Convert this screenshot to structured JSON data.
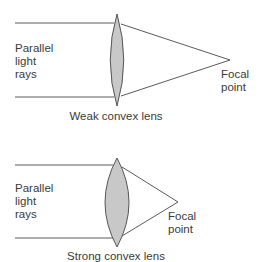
{
  "colors": {
    "line": "#5a5a5a",
    "lens_fill": "#c8c8c8",
    "lens_stroke": "#555555",
    "text": "#3a3a3a",
    "background": "#ffffff"
  },
  "panels": [
    {
      "id": "weak",
      "rays_label": "Parallel\nlight\nrays",
      "focal_label": "Focal\npoint",
      "caption": "Weak convex lens",
      "lens": {
        "cx": 117,
        "top": 14,
        "bottom": 106,
        "half_width": 6.5
      },
      "rays": {
        "x_start": 15,
        "y_top": 23,
        "y_bottom": 97
      },
      "focal_point": {
        "x": 230,
        "y": 60
      }
    },
    {
      "id": "strong",
      "rays_label": "Parallel\nlight\nrays",
      "focal_label": "Focal\npoint",
      "caption": "Strong convex lens",
      "lens": {
        "cx": 117,
        "top": 158,
        "bottom": 247,
        "half_width": 12
      },
      "rays": {
        "x_start": 15,
        "y_top": 165,
        "y_bottom": 238
      },
      "focal_point": {
        "x": 178,
        "y": 202
      }
    }
  ]
}
